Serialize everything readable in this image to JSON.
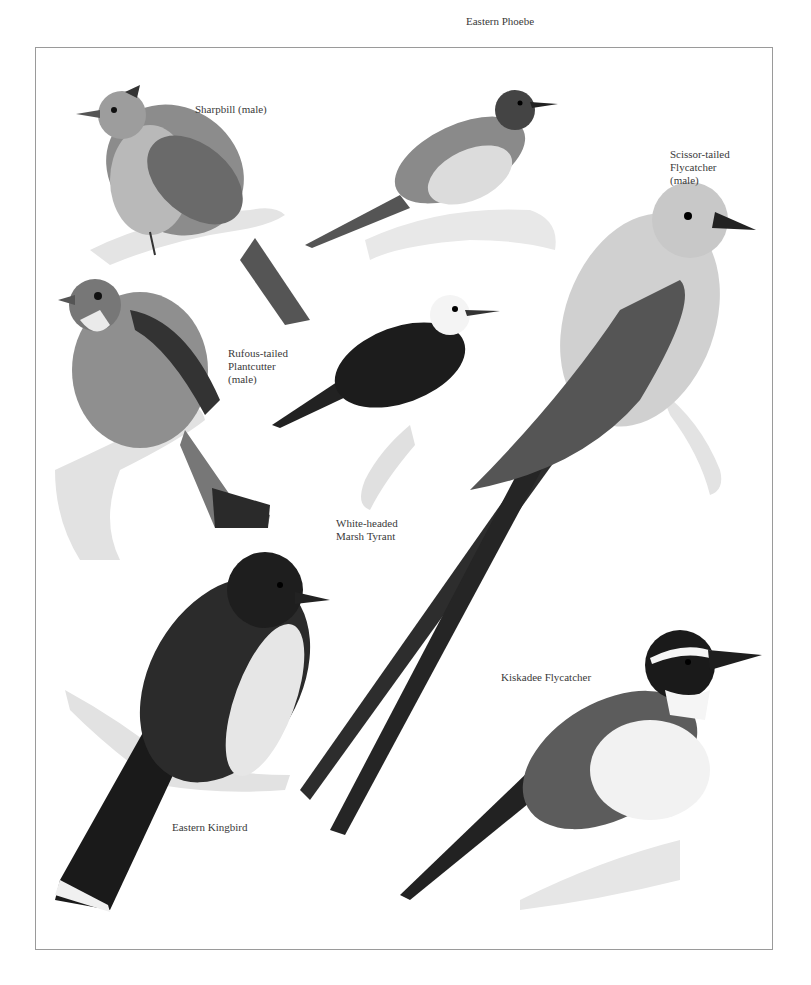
{
  "plate": {
    "labels": {
      "sharpbill": "Sharpbill (male)",
      "eastern_phoebe": "Eastern Phoebe",
      "scissor_tailed": "Scissor-tailed\nFlycatcher\n(male)",
      "plantcutter": "Rufous-tailed\nPlantcutter\n(male)",
      "marsh_tyrant": "White-headed\nMarsh Tyrant",
      "kiskadee": "Kiskadee Flycatcher",
      "kingbird": "Eastern Kingbird"
    }
  }
}
